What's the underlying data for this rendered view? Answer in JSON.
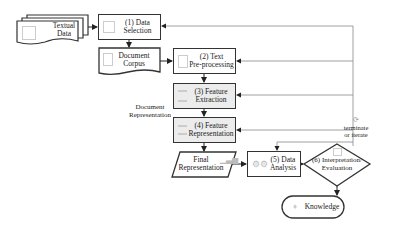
{
  "diagram": {
    "nodes": {
      "textual_data": {
        "line1": "Textual",
        "line2": "Data"
      },
      "data_selection": {
        "line1": "(1) Data",
        "line2": "Selection"
      },
      "document_corpus": {
        "line1": "Document",
        "line2": "Corpus"
      },
      "text_preprocessing": {
        "line1": "(2) Text",
        "line2": "Pre-processing"
      },
      "feature_extraction": {
        "line1": "(3) Feature",
        "line2": "Extraction"
      },
      "feature_representation": {
        "line1": "(4) Feature",
        "line2": "Representation"
      },
      "final_representation": {
        "line1": "Final",
        "line2": "Representation"
      },
      "data_analysis": {
        "line1": "(5) Data",
        "line2": "Analysis"
      },
      "interpretation": {
        "line1": "(6) Interpretation/",
        "line2": "Evaluation"
      },
      "knowledge": {
        "label": "Knowledge"
      }
    },
    "labels": {
      "document_representation": {
        "line1": "Document",
        "line2": "Representation"
      },
      "terminate_iterate": {
        "line1": "terminate",
        "line2": "or iterate"
      }
    },
    "colors": {
      "stroke": "#333333",
      "shaded": "#ececec",
      "feedback_line": "#888888",
      "icon": "#bbbbbb"
    }
  }
}
